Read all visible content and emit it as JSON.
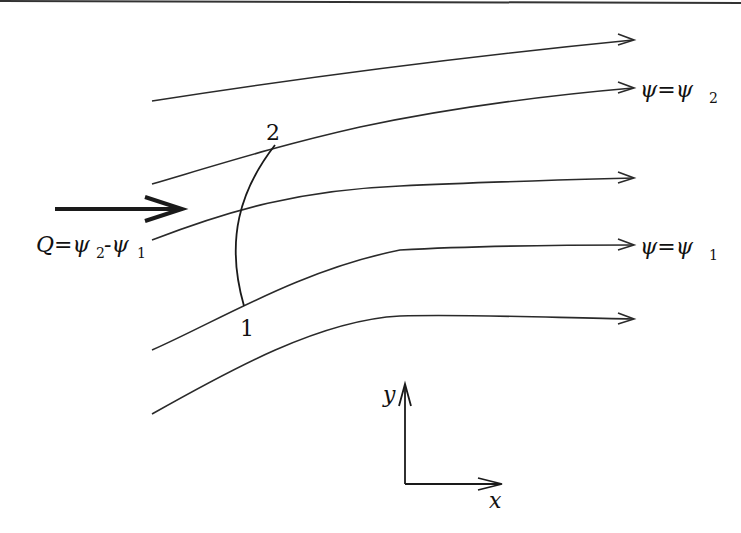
{
  "diagram": {
    "streamlines": [
      {
        "id": "streamline-1",
        "label": ""
      },
      {
        "id": "streamline-2",
        "label": "ψ=ψ2",
        "label_main": "ψ=ψ",
        "label_sub": "2"
      },
      {
        "id": "streamline-3",
        "label": ""
      },
      {
        "id": "streamline-4",
        "label": "ψ=ψ1",
        "label_main": "ψ=ψ",
        "label_sub": "1"
      },
      {
        "id": "streamline-5",
        "label": ""
      }
    ],
    "flow_label": {
      "text": "Q=ψ2-ψ1",
      "q": "Q",
      "eq": "=ψ",
      "sub2": "2",
      "minus": "-ψ",
      "sub1": "1"
    },
    "curve_points": {
      "point_1": "1",
      "point_2": "2"
    },
    "axes": {
      "x_label": "x",
      "y_label": "y"
    }
  }
}
